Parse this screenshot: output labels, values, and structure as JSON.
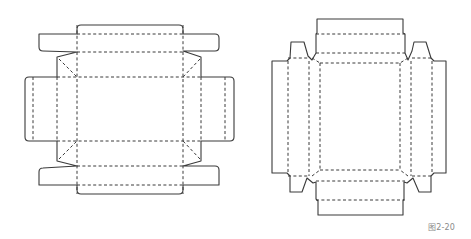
{
  "figure": {
    "caption": "图2-20",
    "diagrams": [
      {
        "id": "left",
        "description": "Box die-cut net with rounded glue flaps and mitred corner gussets"
      },
      {
        "id": "right",
        "description": "Tray die-cut net with tapered corner locking tabs"
      }
    ],
    "colors": {
      "line": "#3a3a3a",
      "background": "#ffffff",
      "caption": "#8a8a8a"
    }
  }
}
